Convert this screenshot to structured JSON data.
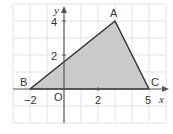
{
  "figure": {
    "type": "coordinate-plane-triangle",
    "axes": {
      "x_label": "x",
      "y_label": "y",
      "origin_label": "O",
      "x_ticks": [
        {
          "value": -2,
          "label": "−2"
        },
        {
          "value": 2,
          "label": "2"
        },
        {
          "value": 5,
          "label": "5"
        }
      ],
      "y_ticks": [
        {
          "value": 2,
          "label": "2"
        },
        {
          "value": 4,
          "label": "4"
        }
      ],
      "x_range": [
        -3,
        6
      ],
      "y_range": [
        -2,
        5
      ],
      "grid": true
    },
    "points": [
      {
        "name": "A",
        "x": 3,
        "y": 4
      },
      {
        "name": "B",
        "x": -2,
        "y": 0
      },
      {
        "name": "C",
        "x": 5,
        "y": 0
      }
    ],
    "triangle": {
      "vertices": [
        "A",
        "B",
        "C"
      ],
      "fill": "#c8c8c8",
      "stroke": "#333333"
    },
    "colors": {
      "grid": "#e0e0e0",
      "axis": "#555555",
      "text": "#333333"
    }
  }
}
